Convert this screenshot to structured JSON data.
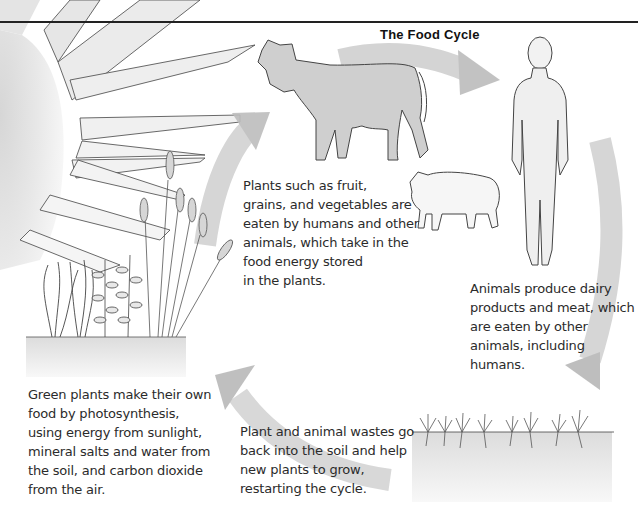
{
  "diagram": {
    "title": "The Food Cycle",
    "captions": {
      "plants_eaten": "Plants such as fruit,\ngrains, and vegetables are\neaten by humans and other\nanimals, which take in the\nfood energy stored\nin the plants.",
      "animals_produce": "Animals produce dairy\nproducts and meat, which\nare eaten by other\nanimals, including\nhumans.",
      "green_plants": "Green plants make their own\nfood by photosynthesis,\nusing energy from sunlight,\nmineral salts and water from\nthe soil, and carbon dioxide\nfrom the air.",
      "wastes": "Plant and animal wastes go\nback into the soil and help\nnew plants to grow,\nrestarting the cycle."
    },
    "illustrations": [
      "sun-rays",
      "plants-wheat",
      "cow",
      "sheep",
      "human",
      "soil-with-seedlings"
    ],
    "colors": {
      "arrow": "#c8c8c8",
      "sun": "#e2e2e2",
      "outline": "#333333",
      "soil": "#e6e6e6",
      "text": "#2b2b2b"
    }
  }
}
